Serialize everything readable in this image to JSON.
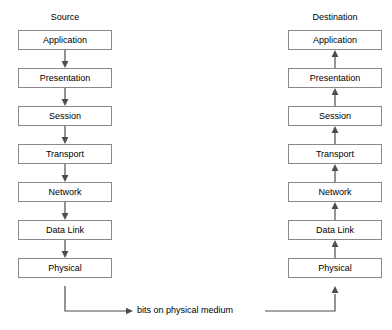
{
  "diagram": {
    "title_source": "Source",
    "title_destination": "Destination",
    "medium_label": "bits on physical medium",
    "layers": [
      "Application",
      "Presentation",
      "Session",
      "Transport",
      "Network",
      "Data Link",
      "Physical"
    ],
    "source_flow_direction": "down",
    "destination_flow_direction": "up",
    "colors": {
      "background": "#ffffff",
      "box_border": "#8a8a8a",
      "text": "#000000",
      "connector": "#4d4d4d"
    }
  }
}
